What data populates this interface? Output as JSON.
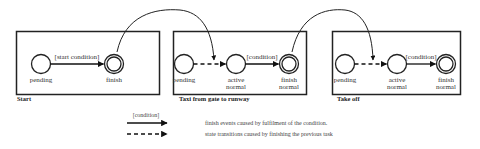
{
  "diagram": {
    "boxes": [
      {
        "title": "Start",
        "states": [
          {
            "label1": "pending",
            "label2": ""
          },
          {
            "label1": "finish",
            "label2": ""
          }
        ],
        "transition_condition": "[start condition]"
      },
      {
        "title": "Taxi from gate to runway",
        "states": [
          {
            "label1": "pending",
            "label2": ""
          },
          {
            "label1": "active",
            "label2": "normal"
          },
          {
            "label1": "finish",
            "label2": "normal"
          }
        ],
        "transition_condition": "[condition]"
      },
      {
        "title": "Take off",
        "states": [
          {
            "label1": "pending",
            "label2": ""
          },
          {
            "label1": "active",
            "label2": "normal"
          },
          {
            "label1": "finish",
            "label2": "normal"
          }
        ],
        "transition_condition": "[condition]"
      }
    ],
    "legend": {
      "solid_arrow_label": "[condition]",
      "solid_arrow_text": "finish events caused by fulfilment of the condition.",
      "dashed_arrow_text": "state transitions caused by finishing the previous task"
    }
  }
}
